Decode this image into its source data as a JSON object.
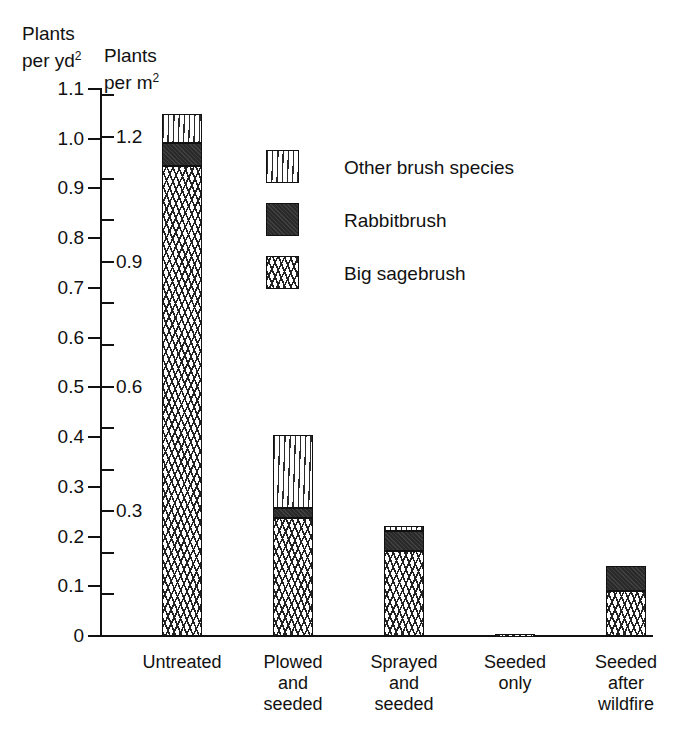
{
  "axis_titles": {
    "left_line1": "Plants",
    "left_line2": "per yd",
    "left_sup": "2",
    "right_line1": "Plants",
    "right_line2": "per m",
    "right_sup": "2"
  },
  "legend": {
    "items": [
      {
        "label": "Other brush species",
        "pattern": "sparse-vertical-dash-hatch",
        "color": "#ffffff"
      },
      {
        "label": "Rabbitbrush",
        "pattern": "solid-dark",
        "color": "#2a2a2a"
      },
      {
        "label": "Big sagebrush",
        "pattern": "dense-squiggle-hatch",
        "color": "#ffffff"
      }
    ]
  },
  "chart_data": {
    "type": "bar",
    "subtype": "stacked",
    "title": "",
    "xlabel": "",
    "ylabel": "Plants per yd²",
    "ylabel_secondary": "Plants per m²",
    "ylim": [
      0,
      1.1
    ],
    "ylim_secondary": [
      0,
      1.3154
    ],
    "grid": false,
    "legend_position": "upper-center-right",
    "yticks_left": [
      "0",
      "0.1",
      "0.2",
      "0.3",
      "0.4",
      "0.5",
      "0.6",
      "0.7",
      "0.8",
      "0.9",
      "1.0",
      "1.1"
    ],
    "yticks_left_values": [
      0,
      0.1,
      0.2,
      0.3,
      0.4,
      0.5,
      0.6,
      0.7,
      0.8,
      0.9,
      1.0,
      1.1
    ],
    "yticks_right_labeled": [
      "0.3",
      "0.6",
      "0.9",
      "1.2"
    ],
    "yticks_right_labeled_values": [
      0.3,
      0.6,
      0.9,
      1.2
    ],
    "yticks_right_minor_values": [
      0.1,
      0.2,
      0.4,
      0.5,
      0.7,
      0.8,
      1.0,
      1.1,
      1.3
    ],
    "categories": [
      "Untreated",
      "Plowed and seeded",
      "Sprayed and seeded",
      "Seeded only",
      "Seeded after wildfire"
    ],
    "category_label_lines": [
      [
        "Untreated"
      ],
      [
        "Plowed",
        "and",
        "seeded"
      ],
      [
        "Sprayed",
        "and",
        "seeded"
      ],
      [
        "Seeded",
        "only"
      ],
      [
        "Seeded",
        "after",
        "wildfire"
      ]
    ],
    "series": [
      {
        "name": "Big sagebrush",
        "values": [
          0.945,
          0.238,
          0.171,
          0.004,
          0.09
        ]
      },
      {
        "name": "Rabbitbrush",
        "values": [
          0.046,
          0.02,
          0.041,
          0.0,
          0.051
        ]
      },
      {
        "name": "Other brush species",
        "values": [
          0.059,
          0.147,
          0.01,
          0.0,
          0.0
        ]
      }
    ],
    "totals": [
      1.05,
      0.405,
      0.222,
      0.004,
      0.141
    ],
    "units": "plants per yd²"
  }
}
